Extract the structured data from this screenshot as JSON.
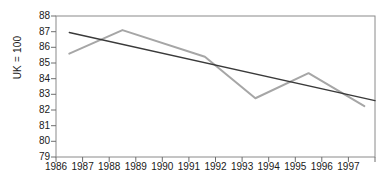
{
  "chart_data": {
    "type": "line",
    "title": "",
    "subtitle": "",
    "xlabel": "",
    "ylabel": "UK = 100",
    "xlim": [
      1986,
      1998
    ],
    "ylim": [
      79,
      88
    ],
    "grid": false,
    "legend": "none",
    "y_ticks": [
      88,
      87,
      86,
      85,
      84,
      83,
      82,
      81,
      80,
      79
    ],
    "x_ticks": [
      1986,
      1987,
      1988,
      1989,
      1990,
      1991,
      1992,
      1993,
      1994,
      1995,
      1996,
      1997
    ],
    "series": [
      {
        "name": "index",
        "color": "#a6a6a6",
        "x": [
          1986.5,
          1988.5,
          1991.6,
          1993.5,
          1995.5,
          1997.6
        ],
        "values": [
          85.6,
          87.1,
          85.4,
          82.75,
          84.35,
          82.25
        ]
      },
      {
        "name": "trend",
        "color": "#3a3a3a",
        "x": [
          1986.5,
          1998.0
        ],
        "values": [
          86.95,
          82.6
        ]
      }
    ],
    "colors": {
      "series_line": "#a6a6a6",
      "trend_line": "#3a3a3a",
      "axis": "#8a8a8a",
      "text": "#1a1a1a",
      "background": "#ffffff"
    }
  }
}
